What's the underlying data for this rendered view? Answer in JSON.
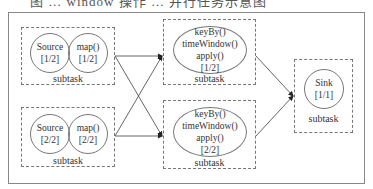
{
  "caption": "图 … window 操作 … 并行任务示意图",
  "subtask_label": "subtask",
  "left_top": {
    "source": {
      "name": "Source",
      "index": "[1/2]"
    },
    "map": {
      "name": "map()",
      "index": "[1/2]"
    }
  },
  "left_bottom": {
    "source": {
      "name": "Source",
      "index": "[2/2]"
    },
    "map": {
      "name": "map()",
      "index": "[2/2]"
    }
  },
  "mid_top": {
    "lines": [
      "keyBy()",
      "timeWindow()",
      "apply()",
      "[1/2]"
    ]
  },
  "mid_bottom": {
    "lines": [
      "keyBy()",
      "timeWindow()",
      "apply()",
      "[2/2]"
    ]
  },
  "sink": {
    "name": "Sink",
    "index": "[1/1]"
  }
}
